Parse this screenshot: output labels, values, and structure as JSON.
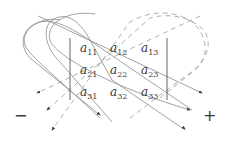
{
  "diagram": {
    "matrix": {
      "entries": [
        [
          {
            "base": "a",
            "sub": "11"
          },
          {
            "base": "a",
            "sub": "12"
          },
          {
            "base": "a",
            "sub": "13"
          }
        ],
        [
          {
            "base": "a",
            "sub": "21"
          },
          {
            "base": "a",
            "sub": "22"
          },
          {
            "base": "a",
            "sub": "23"
          }
        ],
        [
          {
            "base": "a",
            "sub": "31"
          },
          {
            "base": "a",
            "sub": "32"
          },
          {
            "base": "a",
            "sub": "33"
          }
        ]
      ],
      "delimiter": "vertical-bars"
    },
    "signs": {
      "negative": "−",
      "positive": "+"
    },
    "diagonals": {
      "positive_style": "solid",
      "negative_style": "dashed",
      "count_each": 3
    },
    "colors": {
      "line": "#8a8a8a",
      "text": "#3a3a3a",
      "arrow": "#3a3a3a"
    }
  }
}
